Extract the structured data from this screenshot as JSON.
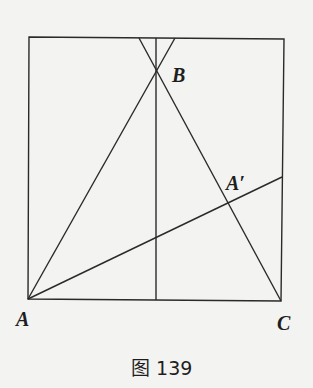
{
  "figure": {
    "caption": "图 139",
    "points": {
      "A": {
        "label": "A",
        "x": 28,
        "y": 299
      },
      "B": {
        "label": "B",
        "x": 156,
        "y": 72
      },
      "C": {
        "label": "C",
        "x": 281,
        "y": 301
      },
      "A_prime": {
        "label": "A′",
        "x": 226,
        "y": 206
      }
    },
    "square": {
      "tl": [
        29,
        37
      ],
      "tr": [
        284,
        39
      ],
      "br": [
        281,
        301
      ],
      "bl": [
        28,
        299
      ]
    },
    "segments": [
      {
        "name": "line-A-through-B",
        "x1": 28,
        "y1": 299,
        "x2": 175,
        "y2": 38
      },
      {
        "name": "line-C-through-B",
        "x1": 281,
        "y1": 301,
        "x2": 139,
        "y2": 38
      },
      {
        "name": "vertical-axis-through-B",
        "x1": 156,
        "y1": 38,
        "x2": 156,
        "y2": 300
      },
      {
        "name": "line-A-through-A-prime",
        "x1": 28,
        "y1": 299,
        "x2": 282,
        "y2": 177
      }
    ]
  }
}
